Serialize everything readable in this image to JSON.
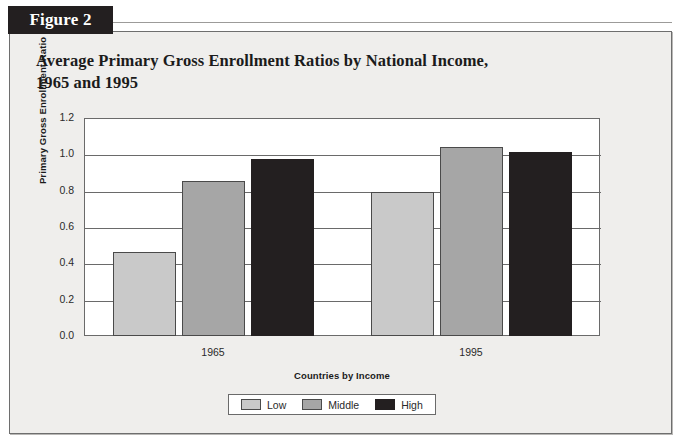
{
  "figure": {
    "tab_label": "Figure 2",
    "title_line1": "Average Primary Gross Enrollment Ratios by National Income,",
    "title_line2": "1965 and 1995"
  },
  "chart_data": {
    "type": "bar",
    "title": "Average Primary Gross Enrollment Ratios by National Income, 1965 and 1995",
    "xlabel": "Countries by Income",
    "ylabel": "Primary Gross Enrollment Ratio",
    "categories": [
      "1965",
      "1995"
    ],
    "series": [
      {
        "name": "Low",
        "color": "#c9c9c9",
        "values": [
          0.46,
          0.79
        ]
      },
      {
        "name": "Middle",
        "color": "#a6a6a6",
        "values": [
          0.855,
          1.04
        ]
      },
      {
        "name": "High",
        "color": "#231f20",
        "values": [
          0.975,
          1.015
        ]
      }
    ],
    "ylim": [
      0.0,
      1.2
    ],
    "yticks": [
      "0.0",
      "0.2",
      "0.4",
      "0.6",
      "0.8",
      "1.0",
      "1.2"
    ],
    "ytick_values": [
      0.0,
      0.2,
      0.4,
      0.6,
      0.8,
      1.0,
      1.2
    ],
    "grid": true,
    "legend_position": "bottom"
  }
}
